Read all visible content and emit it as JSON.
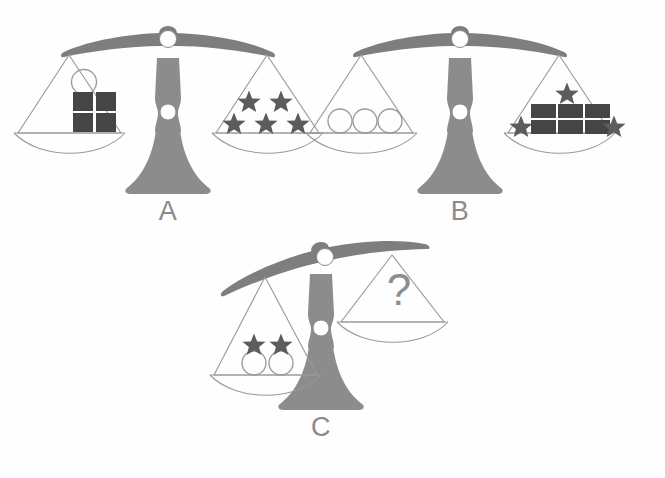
{
  "puzzle": {
    "title": "Balance Scale Equivalence Puzzle",
    "background_color": "#fefefe",
    "colors": {
      "frame": "#8c8c8c",
      "frame_dark": "#7e7e7e",
      "square": "#454545",
      "star": "#5c5c5c",
      "outline": "#9a9a9a",
      "label": "#8a8a8a",
      "question": "#8e8e8e",
      "pivot": "#ffffff"
    },
    "scales": [
      {
        "id": "scale-a",
        "label": "A",
        "tilt": "balanced",
        "left_pan": {
          "name": "scale-a-left-pan",
          "items": [
            {
              "shape": "circle",
              "count": 1,
              "fill": "none"
            },
            {
              "shape": "square",
              "count": 4,
              "fill": "#454545",
              "arrangement": "2x2"
            }
          ]
        },
        "right_pan": {
          "name": "scale-a-right-pan",
          "items": [
            {
              "shape": "star",
              "count": 5,
              "fill": "#5c5c5c",
              "arrangement": "2-over-3"
            }
          ]
        }
      },
      {
        "id": "scale-b",
        "label": "B",
        "tilt": "balanced",
        "left_pan": {
          "name": "scale-b-left-pan",
          "items": [
            {
              "shape": "circle",
              "count": 3,
              "fill": "none",
              "arrangement": "row"
            }
          ]
        },
        "right_pan": {
          "name": "scale-b-right-pan",
          "items": [
            {
              "shape": "star",
              "count": 3,
              "fill": "#5c5c5c",
              "arrangement": "1-top-2-bottom-corners"
            },
            {
              "shape": "square",
              "count": 6,
              "fill": "#454545",
              "arrangement": "3x2"
            }
          ]
        }
      },
      {
        "id": "scale-c",
        "label": "C",
        "tilt": "left-down",
        "left_pan": {
          "name": "scale-c-left-pan",
          "items": [
            {
              "shape": "circle",
              "count": 2,
              "fill": "none",
              "arrangement": "row"
            },
            {
              "shape": "star",
              "count": 2,
              "fill": "#5c5c5c",
              "arrangement": "row"
            }
          ]
        },
        "right_pan": {
          "name": "scale-c-right-pan",
          "items": [
            {
              "shape": "question-mark",
              "count": 1,
              "text": "?"
            }
          ]
        }
      }
    ]
  }
}
